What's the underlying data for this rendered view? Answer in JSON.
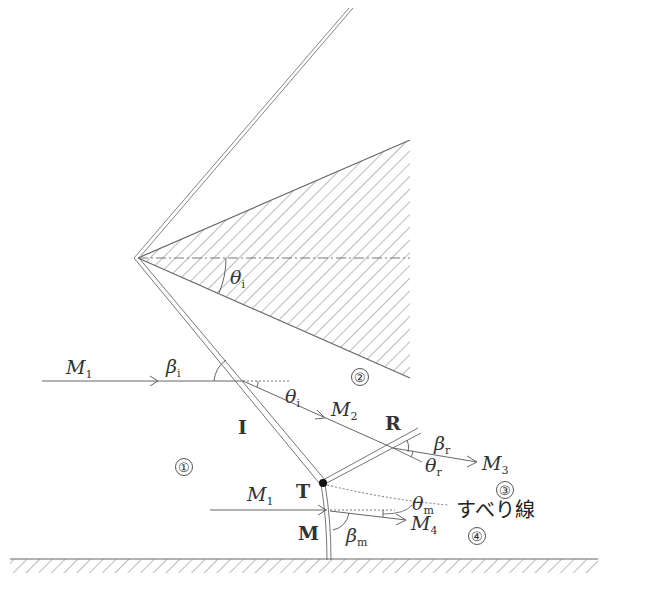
{
  "diagram": {
    "type": "Mach reflection schematic (shock wave reflection from wedge)",
    "labels": {
      "M1_upper": {
        "base": "M",
        "sub": "1"
      },
      "M1_lower": {
        "base": "M",
        "sub": "1"
      },
      "M2": {
        "base": "M",
        "sub": "2"
      },
      "M3": {
        "base": "M",
        "sub": "3"
      },
      "M4": {
        "base": "M",
        "sub": "4"
      },
      "beta_i": {
        "base": "β",
        "sub": "i"
      },
      "beta_r": {
        "base": "β",
        "sub": "r"
      },
      "beta_m": {
        "base": "β",
        "sub": "m"
      },
      "theta_i_wedge": {
        "base": "θ",
        "sub": "i"
      },
      "theta_i": {
        "base": "θ",
        "sub": "i"
      },
      "theta_r": {
        "base": "θ",
        "sub": "r"
      },
      "theta_m": {
        "base": "θ",
        "sub": "m"
      },
      "incident_shock": "I",
      "reflected_shock": "R",
      "triple_point": "T",
      "mach_stem": "M",
      "slip_line": "すべり線"
    },
    "regions": [
      "①",
      "②",
      "③",
      "④"
    ]
  }
}
